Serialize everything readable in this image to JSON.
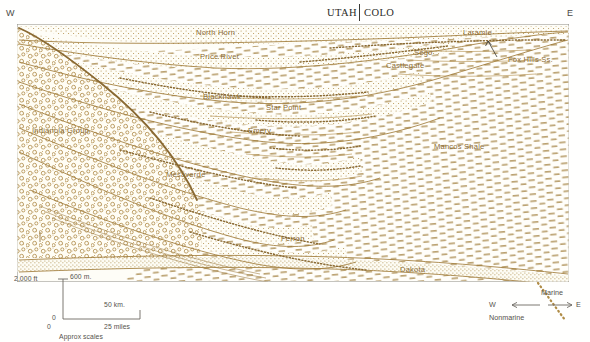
{
  "figure": {
    "type": "geologic-cross-section",
    "region": "Book Cliffs / Wasatch Plateau, Cretaceous clastic wedge",
    "orientation_left": "W",
    "orientation_right": "E",
    "state_left": "UTAH",
    "state_right": "COLO"
  },
  "colors": {
    "ink": "#8a6a33",
    "ink_dark": "#7d5f2c",
    "ink_line": "#a07c3a",
    "stipple": "#b08c46",
    "dash": "#a48243",
    "frame": "#8d8b85",
    "text_gray": "#55524c",
    "text_dark": "#2b2b28",
    "background": "#fffffd",
    "panel_fill": "#fefdf7"
  },
  "header": {
    "west_label": "W",
    "east_label": "E",
    "state_left": "UTAH",
    "state_right": "COLO"
  },
  "formations": [
    {
      "name": "North Horn",
      "x": 196,
      "y": 33,
      "type": "nonmarine"
    },
    {
      "name": "Price River",
      "x": 200,
      "y": 57,
      "type": "nonmarine"
    },
    {
      "name": "Blackhawk",
      "x": 203,
      "y": 97,
      "type": "nonmarine"
    },
    {
      "name": "Indianola Group",
      "x": 32,
      "y": 131,
      "type": "conglomerate"
    },
    {
      "name": "Star Point",
      "x": 266,
      "y": 108,
      "type": "marginal"
    },
    {
      "name": "Emery",
      "x": 248,
      "y": 131,
      "type": "marginal"
    },
    {
      "name": "Mesaverde",
      "x": 166,
      "y": 175,
      "type": "nonmarine"
    },
    {
      "name": "Castlegate",
      "x": 386,
      "y": 66,
      "type": "nonmarine"
    },
    {
      "name": "Sego",
      "x": 414,
      "y": 53,
      "type": "marginal"
    },
    {
      "name": "Laramie",
      "x": 463,
      "y": 33,
      "type": "nonmarine"
    },
    {
      "name": "Fox Hills Ss.",
      "x": 512,
      "y": 60,
      "type": "marine-sand"
    },
    {
      "name": "Mancos Shale",
      "x": 440,
      "y": 147,
      "type": "marine-shale"
    },
    {
      "name": "Ferron",
      "x": 281,
      "y": 239,
      "type": "marginal"
    },
    {
      "name": "Dakota",
      "x": 403,
      "y": 270,
      "type": "basal-sand"
    }
  ],
  "scale_bar": {
    "vertical_top_left": "2,000 ft",
    "vertical_top_right": "600 m.",
    "vertical_bottom_left": "0",
    "horizontal_left": "0",
    "horizontal_right_top": "50 km.",
    "horizontal_right_bottom": "25 miles",
    "caption": "Approx scales"
  },
  "legend": {
    "west_label": "W",
    "east_label": "E",
    "upper_label": "Marine",
    "lower_label": "Nonmarine"
  }
}
